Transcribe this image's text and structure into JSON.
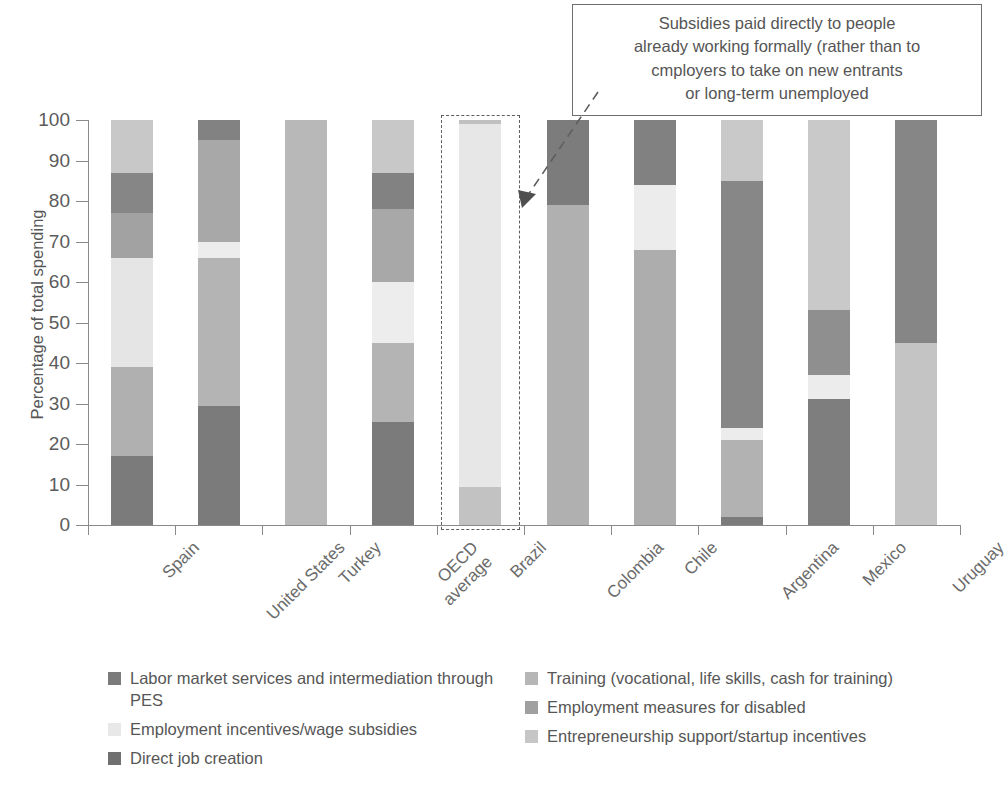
{
  "chart_data": {
    "type": "bar",
    "subtype": "stacked-bar-100",
    "title": "",
    "xlabel": "",
    "ylabel": "Percentage of total spending",
    "ylim": [
      0,
      100
    ],
    "yticks": [
      0,
      10,
      20,
      30,
      40,
      50,
      60,
      70,
      80,
      90,
      100
    ],
    "ytick_labels": [
      "0",
      "10",
      "20",
      "30",
      "40",
      "50",
      "60",
      "70",
      "80",
      "90",
      "100"
    ],
    "grid": false,
    "legend_position": "bottom",
    "categories": [
      "Spain",
      "United States",
      "Turkey",
      "OECD average",
      "Brazil",
      "Colombia",
      "Chile",
      "Argentina",
      "Mexico",
      "Uruguay"
    ],
    "category_lines": [
      [
        "Spain"
      ],
      [
        "United States"
      ],
      [
        "Turkey"
      ],
      [
        "OECD",
        "average"
      ],
      [
        "Brazil"
      ],
      [
        "Colombia"
      ],
      [
        "Chile"
      ],
      [
        "Argentina"
      ],
      [
        "Mexico"
      ],
      [
        "Uruguay"
      ]
    ],
    "series": [
      {
        "name": "Labor market services and intermediation through PES",
        "color": "#7b7b7b",
        "values": [
          17,
          29.5,
          0,
          25.5,
          0,
          0,
          0,
          2,
          31,
          0
        ]
      },
      {
        "name": "Training (vocational, life skills, cash for training)",
        "color": "#adadad",
        "values": [
          22,
          36.5,
          100,
          19.5,
          0,
          79,
          68,
          19,
          0,
          0
        ]
      },
      {
        "name": "Employment incentives/wage subsidies",
        "color": "#e8e8e8",
        "values": [
          27,
          4,
          0,
          15,
          90.5,
          0,
          16,
          3,
          6,
          0
        ]
      },
      {
        "name": "Employment measures for disabled",
        "color": "#9c9c9c",
        "values": [
          11,
          25,
          0,
          18,
          0,
          0,
          0,
          0,
          16,
          0
        ]
      },
      {
        "name": "Direct job creation",
        "color": "#707070",
        "values": [
          10,
          5,
          0,
          9,
          0,
          21,
          16,
          61,
          0,
          55
        ]
      },
      {
        "name": "Entrepreneurship support/startup incentives",
        "color": "#c6c6c6",
        "values": [
          13,
          0,
          0,
          13,
          9.5,
          0,
          0,
          15,
          47,
          45
        ]
      }
    ],
    "stacks": [
      {
        "category": "Spain",
        "segments": [
          {
            "series": "Labor market services and intermediation through PES",
            "from": 0,
            "to": 17,
            "color": "#7b7b7b"
          },
          {
            "series": "Training (vocational, life skills, cash for training)",
            "from": 17,
            "to": 39,
            "color": "#b0b0b0"
          },
          {
            "series": "Employment incentives/wage subsidies",
            "from": 39,
            "to": 66,
            "color": "#e5e5e5"
          },
          {
            "series": "Employment measures for disabled",
            "from": 66,
            "to": 77,
            "color": "#a2a2a2"
          },
          {
            "series": "Direct job creation",
            "from": 77,
            "to": 87,
            "color": "#868686"
          },
          {
            "series": "Entrepreneurship support/startup incentives",
            "from": 87,
            "to": 100,
            "color": "#c8c8c8"
          }
        ]
      },
      {
        "category": "United States",
        "segments": [
          {
            "series": "Labor market services and intermediation through PES",
            "from": 0,
            "to": 29.5,
            "color": "#7b7b7b"
          },
          {
            "series": "Training (vocational, life skills, cash for training)",
            "from": 29.5,
            "to": 66,
            "color": "#b4b4b4"
          },
          {
            "series": "Employment incentives/wage subsidies",
            "from": 66,
            "to": 70,
            "color": "#ededed"
          },
          {
            "series": "Employment measures for disabled",
            "from": 70,
            "to": 95,
            "color": "#a8a8a8"
          },
          {
            "series": "Direct job creation",
            "from": 95,
            "to": 100,
            "color": "#828282"
          }
        ]
      },
      {
        "category": "Turkey",
        "segments": [
          {
            "series": "Training (vocational, life skills, cash for training)",
            "from": 0,
            "to": 100,
            "color": "#b8b8b8"
          }
        ]
      },
      {
        "category": "OECD average",
        "segments": [
          {
            "series": "Labor market services and intermediation through PES",
            "from": 0,
            "to": 25.5,
            "color": "#7b7b7b"
          },
          {
            "series": "Training (vocational, life skills, cash for training)",
            "from": 25.5,
            "to": 45,
            "color": "#b4b4b4"
          },
          {
            "series": "Employment incentives/wage subsidies",
            "from": 45,
            "to": 60,
            "color": "#ededed"
          },
          {
            "series": "Employment measures for disabled",
            "from": 60,
            "to": 78,
            "color": "#a8a8a8"
          },
          {
            "series": "Direct job creation",
            "from": 78,
            "to": 87,
            "color": "#828282"
          },
          {
            "series": "Entrepreneurship support/startup incentives",
            "from": 87,
            "to": 100,
            "color": "#c8c8c8"
          }
        ]
      },
      {
        "category": "Brazil",
        "segments": [
          {
            "series": "Entrepreneurship support/startup incentives",
            "from": 0,
            "to": 9.5,
            "color": "#c2c2c2"
          },
          {
            "series": "Employment incentives/wage subsidies",
            "from": 9.5,
            "to": 99,
            "color": "#e7e7e7"
          },
          {
            "series": "Training (vocational, life skills, cash for training)",
            "from": 99,
            "to": 100,
            "color": "#c0c0c0"
          }
        ]
      },
      {
        "category": "Colombia",
        "segments": [
          {
            "series": "Training (vocational, life skills, cash for training)",
            "from": 0,
            "to": 79,
            "color": "#b0b0b0"
          },
          {
            "series": "Direct job creation",
            "from": 79,
            "to": 100,
            "color": "#7c7c7c"
          }
        ]
      },
      {
        "category": "Chile",
        "segments": [
          {
            "series": "Training (vocational, life skills, cash for training)",
            "from": 0,
            "to": 68,
            "color": "#adadad"
          },
          {
            "series": "Employment incentives/wage subsidies",
            "from": 68,
            "to": 84,
            "color": "#ececec"
          },
          {
            "series": "Direct job creation",
            "from": 84,
            "to": 100,
            "color": "#818181"
          }
        ]
      },
      {
        "category": "Argentina",
        "segments": [
          {
            "series": "Labor market services and intermediation through PES",
            "from": 0,
            "to": 2,
            "color": "#7b7b7b"
          },
          {
            "series": "Training (vocational, life skills, cash for training)",
            "from": 2,
            "to": 21,
            "color": "#b2b2b2"
          },
          {
            "series": "Employment incentives/wage subsidies",
            "from": 21,
            "to": 24,
            "color": "#ececec"
          },
          {
            "series": "Direct job creation",
            "from": 24,
            "to": 85,
            "color": "#878787"
          },
          {
            "series": "Entrepreneurship support/startup incentives",
            "from": 85,
            "to": 100,
            "color": "#c9c9c9"
          }
        ]
      },
      {
        "category": "Mexico",
        "segments": [
          {
            "series": "Labor market services and intermediation through PES",
            "from": 0,
            "to": 31,
            "color": "#7e7e7e"
          },
          {
            "series": "Employment incentives/wage subsidies",
            "from": 31,
            "to": 37,
            "color": "#ececec"
          },
          {
            "series": "Employment measures for disabled",
            "from": 37,
            "to": 53,
            "color": "#8f8f8f"
          },
          {
            "series": "Entrepreneurship support/startup incentives",
            "from": 53,
            "to": 100,
            "color": "#c9c9c9"
          }
        ]
      },
      {
        "category": "Uruguay",
        "segments": [
          {
            "series": "Entrepreneurship support/startup incentives",
            "from": 0,
            "to": 45,
            "color": "#c4c4c4"
          },
          {
            "series": "Direct job creation",
            "from": 45,
            "to": 100,
            "color": "#868686"
          }
        ]
      }
    ],
    "annotations": [
      {
        "text": "Subsidies paid directly to people already working formally (rather than to cmployers to take on new entrants or long-term unemployed",
        "lines": [
          "Subsidies paid directly to people",
          "already working formally (rather than to",
          "cmployers to take on new entrants",
          "or long-term unemployed"
        ],
        "points_to": "Brazil"
      }
    ],
    "highlighted_category": "Brazil"
  },
  "legend": {
    "left_items": [
      {
        "label": "Labor market services and intermediation through PES",
        "color": "#7b7b7b"
      },
      {
        "label": "Employment incentives/wage subsidies",
        "color": "#e8e8e8"
      },
      {
        "label": "Direct job creation",
        "color": "#707070"
      }
    ],
    "right_items": [
      {
        "label": "Training (vocational, life skills, cash for training)",
        "color": "#b6b6b6"
      },
      {
        "label": "Employment measures for disabled",
        "color": "#a0a0a0"
      },
      {
        "label": "Entrepreneurship support/startup incentives",
        "color": "#c6c6c6"
      }
    ]
  }
}
